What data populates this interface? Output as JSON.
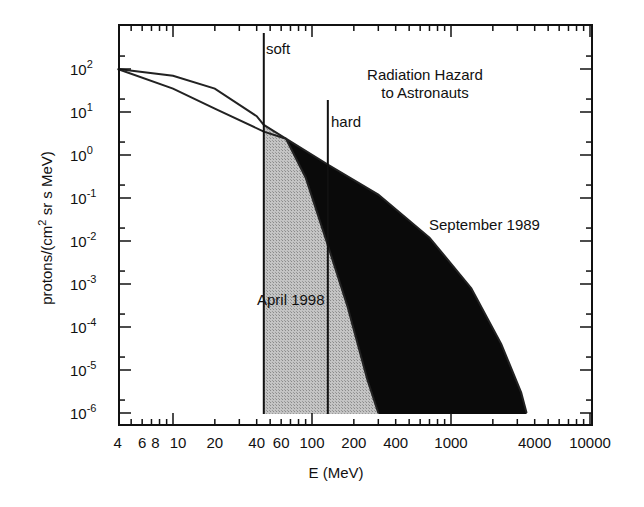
{
  "chart_data": {
    "type": "area",
    "title": "Radiation Hazard to Astronauts",
    "title_lines": [
      "Radiation Hazard",
      "to Astronauts"
    ],
    "xlabel": "E (MeV)",
    "ylabel": "protons/(cm2 sr s MeV)",
    "ylabel_parts": {
      "pre": "protons/(cm",
      "sup": "2",
      "post": " sr s MeV)"
    },
    "xscale": "log",
    "yscale": "log",
    "xlim": [
      4,
      10000
    ],
    "ylim": [
      1e-06,
      1000
    ],
    "x_tick_labels": [
      "4",
      "6",
      "8",
      "10",
      "20",
      "40",
      "60",
      "100",
      "200",
      "400",
      "1000",
      "4000",
      "10000"
    ],
    "x_tick_values": [
      4,
      6,
      8,
      10,
      20,
      40,
      60,
      100,
      200,
      400,
      1000,
      4000,
      10000
    ],
    "y_tick_labels": [
      {
        "base": "10",
        "exp": "2",
        "value": 100
      },
      {
        "base": "10",
        "exp": "1",
        "value": 10
      },
      {
        "base": "10",
        "exp": "0",
        "value": 1
      },
      {
        "base": "10",
        "exp": "-1",
        "value": 0.1
      },
      {
        "base": "10",
        "exp": "-2",
        "value": 0.01
      },
      {
        "base": "10",
        "exp": "-3",
        "value": 0.001
      },
      {
        "base": "10",
        "exp": "-4",
        "value": 0.0001
      },
      {
        "base": "10",
        "exp": "-5",
        "value": 1e-05
      },
      {
        "base": "10",
        "exp": "-6",
        "value": 1e-06
      }
    ],
    "grid": false,
    "series": [
      {
        "name": "September 1989",
        "fill": "#0a0a0a",
        "x": [
          4,
          10,
          20,
          45,
          65,
          130,
          300,
          700,
          1400,
          2300,
          3200,
          3500
        ],
        "y": [
          100,
          35,
          12,
          3.5,
          2.4,
          0.6,
          0.12,
          0.012,
          0.0008,
          4e-05,
          3e-06,
          1e-06
        ]
      },
      {
        "name": "April 1998",
        "fill": "#b8b8b8",
        "x": [
          4,
          10,
          20,
          40,
          45,
          65,
          90,
          130,
          180,
          250,
          300
        ],
        "y": [
          100,
          70,
          35,
          8,
          5,
          2.4,
          0.3,
          0.008,
          0.0003,
          6e-06,
          1e-06
        ]
      }
    ],
    "annotations": [
      {
        "text": "soft",
        "type": "vertical-line",
        "x": 45
      },
      {
        "text": "hard",
        "type": "vertical-line",
        "x": 130
      },
      {
        "text": "September 1989",
        "type": "series-label"
      },
      {
        "text": "April 1998",
        "type": "series-label"
      }
    ]
  }
}
